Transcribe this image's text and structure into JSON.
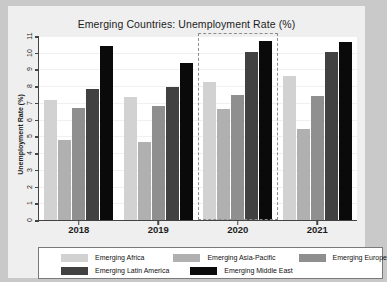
{
  "chart_data": {
    "type": "bar",
    "title": "Emerging Countries: Unemployment Rate (%)",
    "xlabel": "",
    "ylabel": "Unemployment Rate (%)",
    "categories": [
      "2018",
      "2019",
      "2020",
      "2021"
    ],
    "ylim": [
      0,
      11
    ],
    "yticks": [
      "0",
      "1",
      "2",
      "3",
      "4",
      "5",
      "6",
      "7",
      "8",
      "9",
      "10",
      "11"
    ],
    "grid": true,
    "legend_position": "bottom",
    "series": [
      {
        "name": "Emerging Africa",
        "color": "#d2d2d2",
        "values": [
          7.2,
          7.35,
          8.25,
          8.6
        ]
      },
      {
        "name": "Emerging Asia-Pacific",
        "color": "#b0b0b0",
        "values": [
          4.8,
          4.65,
          6.65,
          5.45
        ]
      },
      {
        "name": "Emerging Europe",
        "color": "#8f8f8f",
        "values": [
          6.7,
          6.8,
          7.5,
          7.4
        ]
      },
      {
        "name": "Emerging Latin America",
        "color": "#414141",
        "values": [
          7.85,
          7.95,
          10.05,
          10.05
        ]
      },
      {
        "name": "Emerging Middle East",
        "color": "#0a0a0a",
        "values": [
          10.4,
          9.4,
          10.7,
          10.65
        ]
      }
    ],
    "annotations": [
      {
        "type": "selection-box",
        "style": "dashed",
        "covers_category": "2020",
        "color": "#8c8c8c"
      }
    ]
  },
  "legend": {
    "items": [
      {
        "label": "Emerging Africa",
        "color": "#d2d2d2"
      },
      {
        "label": "Emerging Asia-Pacific",
        "color": "#b0b0b0"
      },
      {
        "label": "Emerging Europe",
        "color": "#8f8f8f"
      },
      {
        "label": "Emerging Latin America",
        "color": "#414141"
      },
      {
        "label": "Emerging Middle East",
        "color": "#0a0a0a"
      }
    ]
  }
}
